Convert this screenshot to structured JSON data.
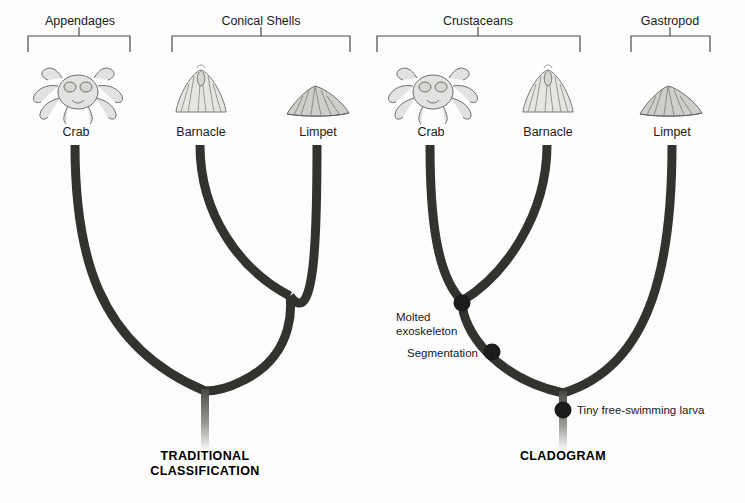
{
  "figure": {
    "background_color": "#fdfdfd",
    "branch_color": "#33322f",
    "node_color": "#1c1c1c",
    "bracket_color": "#4a4a4a",
    "text_color": "#1a1a1a"
  },
  "panels": [
    {
      "id": "traditional",
      "caption": "TRADITIONAL\nCLASSIFICATION",
      "caption_line1": "TRADITIONAL",
      "caption_line2": "CLASSIFICATION",
      "groups": [
        {
          "label": "Appendages",
          "members": [
            "Crab"
          ]
        },
        {
          "label": "Conical Shells",
          "members": [
            "Barnacle",
            "Limpet"
          ]
        }
      ],
      "taxa": [
        {
          "name": "Crab",
          "icon": "crab-illustration"
        },
        {
          "name": "Barnacle",
          "icon": "barnacle-illustration"
        },
        {
          "name": "Limpet",
          "icon": "limpet-illustration"
        }
      ],
      "topology": "(Crab,(Barnacle,Limpet))",
      "nodes": []
    },
    {
      "id": "cladogram",
      "caption": "CLADOGRAM",
      "caption_line1": "CLADOGRAM",
      "caption_line2": "",
      "groups": [
        {
          "label": "Crustaceans",
          "members": [
            "Crab",
            "Barnacle"
          ]
        },
        {
          "label": "Gastropod",
          "members": [
            "Limpet"
          ]
        }
      ],
      "taxa": [
        {
          "name": "Crab",
          "icon": "crab-illustration"
        },
        {
          "name": "Barnacle",
          "icon": "barnacle-illustration"
        },
        {
          "name": "Limpet",
          "icon": "limpet-illustration"
        }
      ],
      "topology": "((Crab,Barnacle),Limpet)",
      "nodes": [
        {
          "label": "Molted\nexoskeleton",
          "line1": "Molted",
          "line2": "exoskeleton"
        },
        {
          "label": "Segmentation",
          "line1": "Segmentation",
          "line2": ""
        },
        {
          "label": "Tiny free-swimming larva",
          "line1": "Tiny free-swimming larva",
          "line2": ""
        }
      ]
    }
  ]
}
